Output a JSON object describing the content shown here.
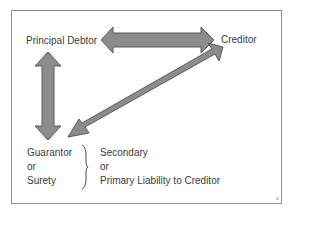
{
  "diagram": {
    "type": "relationship-diagram",
    "nodes": {
      "principal_debtor": "Principal Debtor",
      "creditor": "Creditor",
      "guarantor": {
        "lines": [
          "Guarantor",
          "or",
          "Surety"
        ]
      }
    },
    "liability_note": {
      "lines": [
        "Secondary",
        "or",
        "Primary Liability to Creditor"
      ]
    },
    "edges": [
      {
        "from": "Principal Debtor",
        "to": "Creditor",
        "direction": "bidirectional"
      },
      {
        "from": "Principal Debtor",
        "to": "Guarantor or Surety",
        "direction": "bidirectional"
      },
      {
        "from": "Creditor",
        "to": "Guarantor or Surety",
        "direction": "bidirectional"
      }
    ],
    "colors": {
      "arrow_fill": "#8c8c8c",
      "arrow_stroke": "#5a5a5a",
      "frame_border": "#8f8f8f",
      "text": "#3a3a3a"
    }
  }
}
